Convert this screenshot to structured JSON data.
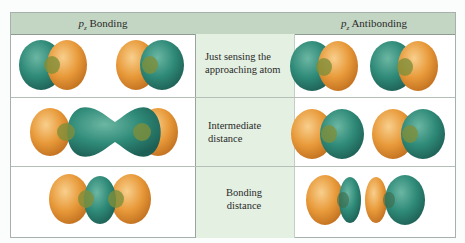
{
  "header": {
    "left_title_symbol": "p",
    "left_title_subscript": "z",
    "left_title_text": " Bonding",
    "right_title_symbol": "p",
    "right_title_subscript": "z",
    "right_title_text": " Antibonding"
  },
  "rows": [
    {
      "label": "Just sensing the approaching atom"
    },
    {
      "label": "Intermediate distance"
    },
    {
      "label": "Bonding distance"
    }
  ],
  "colors": {
    "header_bg": "#c3d6c3",
    "middle_bg": "#e4f0e2",
    "lobe_teal": "#2f8a78",
    "lobe_orange": "#e89a3a",
    "overlap": "#7f8f3a"
  }
}
